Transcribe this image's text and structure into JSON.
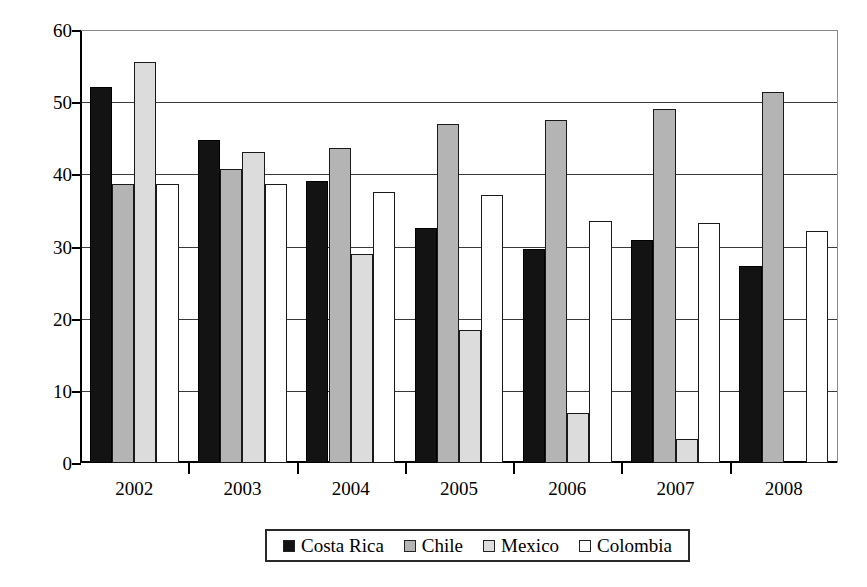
{
  "chart_data": {
    "type": "bar",
    "title": "",
    "xlabel": "",
    "ylabel": "Fuel tax as percentage of retail price",
    "ylim": [
      0,
      60
    ],
    "ytick_step": 10,
    "yticks": [
      0,
      10,
      20,
      30,
      40,
      50,
      60
    ],
    "ytick_labels": [
      "0",
      "10",
      "20",
      "30",
      "40",
      "50",
      "60"
    ],
    "grid": true,
    "legend_position": "bottom",
    "categories": [
      "2002",
      "2003",
      "2004",
      "2005",
      "2006",
      "2007",
      "2008"
    ],
    "series": [
      {
        "name": "Costa Rica",
        "color": "#131313",
        "values": [
          52.1,
          44.8,
          39.1,
          32.6,
          29.6,
          30.9,
          27.3
        ]
      },
      {
        "name": "Chile",
        "color": "#b4b4b4",
        "values": [
          38.7,
          40.8,
          43.7,
          47.0,
          47.6,
          49.1,
          51.4
        ]
      },
      {
        "name": "Mexico",
        "color": "#dcdcdc",
        "values": [
          55.6,
          43.1,
          28.9,
          18.4,
          6.9,
          3.3,
          0
        ]
      },
      {
        "name": "Colombia",
        "color": "#ffffff",
        "values": [
          38.6,
          38.6,
          37.5,
          37.2,
          33.6,
          33.3,
          32.1
        ]
      }
    ]
  },
  "legend": {
    "items": [
      {
        "label": "Costa Rica"
      },
      {
        "label": "Chile"
      },
      {
        "label": "Mexico"
      },
      {
        "label": "Colombia"
      }
    ]
  }
}
